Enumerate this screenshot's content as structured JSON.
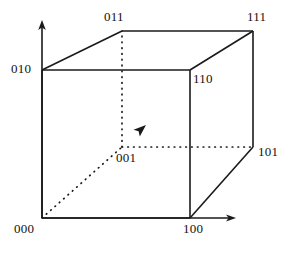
{
  "figure": {
    "name": "binary-cube-diagram",
    "stroke_color": "#1a1a1a",
    "background_color": "#ffffff"
  },
  "vertices": [
    {
      "id": "000",
      "label": "000",
      "x": 42,
      "y": 218,
      "label_x": 14,
      "label_y": 222,
      "hidden": false
    },
    {
      "id": "100",
      "label": "100",
      "x": 190,
      "y": 218,
      "label_x": 183,
      "label_y": 222,
      "hidden": false
    },
    {
      "id": "010",
      "label": "010",
      "x": 42,
      "y": 70,
      "label_x": 11,
      "label_y": 62,
      "hidden": false
    },
    {
      "id": "110",
      "label": "110",
      "x": 190,
      "y": 70,
      "label_x": 193,
      "label_y": 72,
      "hidden": false
    },
    {
      "id": "001",
      "label": "001",
      "x": 122,
      "y": 147,
      "label_x": 116,
      "label_y": 151,
      "hidden": true
    },
    {
      "id": "101",
      "label": "101",
      "x": 253,
      "y": 147,
      "label_x": 258,
      "label_y": 145,
      "hidden": false
    },
    {
      "id": "011",
      "label": "011",
      "x": 122,
      "y": 31,
      "label_x": 104,
      "label_y": 10,
      "hidden": false
    },
    {
      "id": "111",
      "label": "111",
      "x": 253,
      "y": 31,
      "label_x": 247,
      "label_y": 10,
      "hidden": false
    }
  ],
  "edges": [
    {
      "from": "000",
      "to": "100",
      "style": "solid"
    },
    {
      "from": "000",
      "to": "010",
      "style": "solid"
    },
    {
      "from": "100",
      "to": "110",
      "style": "solid"
    },
    {
      "from": "010",
      "to": "110",
      "style": "solid"
    },
    {
      "from": "010",
      "to": "011",
      "style": "solid"
    },
    {
      "from": "110",
      "to": "111",
      "style": "solid"
    },
    {
      "from": "011",
      "to": "111",
      "style": "solid"
    },
    {
      "from": "100",
      "to": "101",
      "style": "solid"
    },
    {
      "from": "101",
      "to": "111",
      "style": "solid"
    },
    {
      "from": "000",
      "to": "001",
      "style": "dotted"
    },
    {
      "from": "001",
      "to": "101",
      "style": "dotted"
    },
    {
      "from": "001",
      "to": "011",
      "style": "dotted"
    }
  ],
  "axes": [
    {
      "id": "y-axis",
      "name": "vertical-axis",
      "from_x": 42,
      "from_y": 218,
      "to_x": 42,
      "to_y": 22
    },
    {
      "id": "x-axis",
      "name": "horizontal-axis",
      "from_x": 42,
      "from_y": 218,
      "to_x": 236,
      "to_y": 218
    },
    {
      "id": "z-axis",
      "name": "depth-axis",
      "from_x": 122,
      "from_y": 147,
      "to_x": 145,
      "to_y": 126
    }
  ]
}
